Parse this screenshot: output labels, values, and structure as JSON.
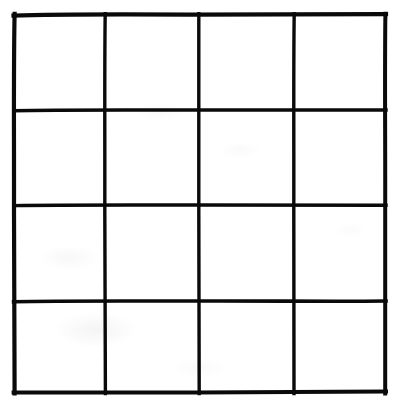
{
  "image": {
    "kind": "hand-drawn-grid-diagram",
    "title": "Blank 4 by 4 grid",
    "background_color": "#ffffff",
    "ink_color": "#0a0a0a",
    "width": 398,
    "height": 406
  },
  "grid": {
    "label": "4x4 grid",
    "rows": 4,
    "columns": 4,
    "cell_count": 16,
    "cell_labels": [
      "",
      "",
      "",
      "",
      "",
      "",
      "",
      "",
      "",
      "",
      "",
      "",
      "",
      "",
      "",
      ""
    ],
    "outer_border_stroke_px": 4,
    "inner_line_stroke_px": 3,
    "bounds": {
      "left": 14,
      "top": 15,
      "right": 385,
      "bottom": 392
    },
    "vertical_line_x": [
      14,
      105,
      199,
      294,
      385
    ],
    "horizontal_line_y": [
      15,
      110,
      205,
      301,
      392
    ],
    "row_heights_px": [
      95,
      95,
      96,
      91
    ],
    "column_widths_px": [
      91,
      94,
      95,
      91
    ]
  }
}
